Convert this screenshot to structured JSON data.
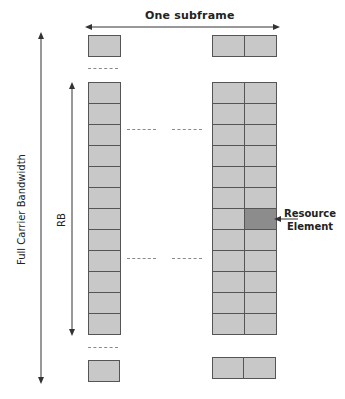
{
  "diagram": {
    "title": "One subframe",
    "axis_full": "Full Carrier Bandwidth",
    "axis_rb": "RB",
    "annotation": {
      "line1": "Resource",
      "line2": "Element"
    },
    "grid": {
      "rows": 12,
      "left_columns": 1,
      "right_columns": 2,
      "highlight": {
        "row": 7,
        "column": 2
      }
    },
    "colors": {
      "cell_fill": "#c8c8c8",
      "cell_border": "#555555",
      "highlight_fill": "#8c8c8c",
      "arrow": "#333333",
      "dash": "#8a8a8a"
    }
  }
}
